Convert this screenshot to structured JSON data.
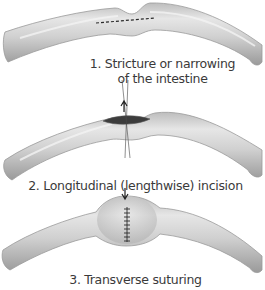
{
  "figure": {
    "steps": [
      {
        "number": "1.",
        "caption_line1": "1. Stricture or narrowing",
        "caption_line2": "of the intestine"
      },
      {
        "number": "2.",
        "caption": "2. Longitudinal (lengthwise) incision"
      },
      {
        "number": "3.",
        "caption": "3. Transverse suturing"
      }
    ]
  },
  "colors": {
    "intestine_fill": "#c8c8c8",
    "intestine_highlight": "#ededed",
    "intestine_shadow": "#8e8e8e",
    "incision": "#3c3c3c",
    "ink": "#222222",
    "text": "#3a3a3a"
  }
}
